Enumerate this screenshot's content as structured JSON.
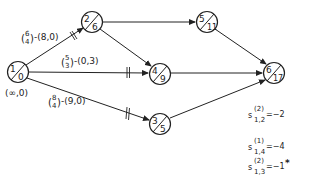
{
  "diagram": {
    "type": "network",
    "nodes": [
      {
        "id": "1",
        "top": "1",
        "bottom": "0",
        "cx": 18,
        "cy": 72
      },
      {
        "id": "2",
        "top": "2",
        "bottom": "6",
        "cx": 92,
        "cy": 22
      },
      {
        "id": "5",
        "top": "5",
        "bottom": "11",
        "cx": 207,
        "cy": 22
      },
      {
        "id": "4",
        "top": "4",
        "bottom": "9",
        "cx": 160,
        "cy": 78
      },
      {
        "id": "3",
        "top": "3",
        "bottom": "5",
        "cx": 160,
        "cy": 124
      },
      {
        "id": "6",
        "top": "6",
        "bottom": "17",
        "cx": 274,
        "cy": 73
      }
    ],
    "edges": [
      {
        "from": "1",
        "to": "2",
        "blocked": true
      },
      {
        "from": "1",
        "to": "4",
        "blocked": true
      },
      {
        "from": "1",
        "to": "3",
        "blocked": true
      },
      {
        "from": "2",
        "to": "5",
        "blocked": false
      },
      {
        "from": "2",
        "to": "4",
        "blocked": false
      },
      {
        "from": "5",
        "to": "6",
        "blocked": false
      },
      {
        "from": "4",
        "to": "6",
        "blocked": false
      },
      {
        "from": "3",
        "to": "6",
        "blocked": false
      }
    ],
    "edge_labels": {
      "e12": {
        "frac_top": "6",
        "frac_bottom": "4",
        "pair": "-(8,0)"
      },
      "e14": {
        "frac_top": "5",
        "frac_bottom": "3",
        "pair": "-(0,3)"
      },
      "e13": {
        "frac_top": "8",
        "frac_bottom": "4",
        "pair": "-(9,0)"
      }
    },
    "source_label": "(∞,0)",
    "annotations": [
      {
        "base": "s",
        "sup": "(2)",
        "sub": "1,2",
        "value": "=−2",
        "mark": ""
      },
      {
        "base": "s",
        "sup": "(1)",
        "sub": "1,4",
        "value": "=−4",
        "mark": ""
      },
      {
        "base": "s",
        "sup": "(2)",
        "sub": "1,3",
        "value": "=−1",
        "mark": "*"
      }
    ]
  }
}
